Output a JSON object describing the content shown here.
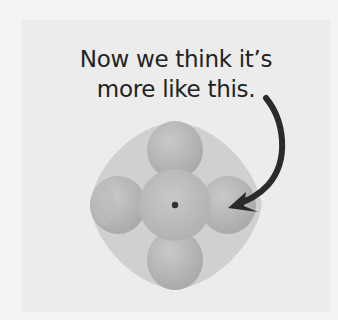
{
  "caption": {
    "line1": "Now we think it’s",
    "line2": "more like this."
  },
  "background_text": {
    "line1": "the full sc",
    "line2": "f this"
  },
  "diagram": {
    "nucleus": "nucleus-dot",
    "lobes": [
      "top",
      "left",
      "right",
      "bottom"
    ],
    "arrow": "curved arrow pointing from caption to right lobe"
  },
  "colors": {
    "panel": "#ececec",
    "halo": "#cfcfcf",
    "lobe": "#b5b5b5",
    "core": "#bdbdbd",
    "nucleus": "#333333",
    "arrow": "#2a2a2a",
    "text": "#222222"
  }
}
